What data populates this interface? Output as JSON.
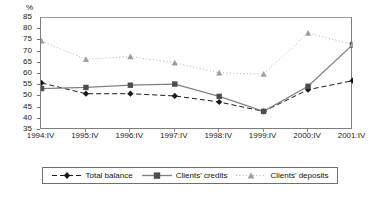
{
  "chart_data": {
    "type": "line",
    "title": "",
    "subtitle": "",
    "xlabel": "",
    "ylabel": "%",
    "unit_label": "%",
    "categories": [
      "1994:IV",
      "1995:IV",
      "1996:IV",
      "1997:IV",
      "1998:IV",
      "1999:IV",
      "2000:IV",
      "2001:IV"
    ],
    "ylim": [
      35,
      85
    ],
    "ytick_values": [
      35,
      40,
      45,
      50,
      55,
      60,
      65,
      70,
      75,
      80,
      85
    ],
    "ytick_labels": [
      "35",
      "40",
      "45",
      "50",
      "55",
      "60",
      "65",
      "70",
      "75",
      "80",
      "85"
    ],
    "grid": false,
    "legend_position": "bottom",
    "series": [
      {
        "name": "Total balance",
        "marker": "diamond",
        "line_style": "dashed",
        "color": "#1a1a1a",
        "values": [
          56.0,
          51.2,
          51.2,
          50.2,
          47.5,
          43.3,
          53.0,
          57.0
        ]
      },
      {
        "name": "Clients' credits",
        "marker": "square",
        "line_style": "solid",
        "color": "#808080",
        "values": [
          53.5,
          54.0,
          55.0,
          55.5,
          50.0,
          43.3,
          54.5,
          73.0
        ]
      },
      {
        "name": "Clients' deposits",
        "marker": "triangle",
        "line_style": "dotted",
        "color": "#b4b4b4",
        "values": [
          74.8,
          66.5,
          67.8,
          65.0,
          60.5,
          60.0,
          78.3,
          73.2
        ]
      }
    ]
  },
  "legend": {
    "items": [
      {
        "label": "Total balance"
      },
      {
        "label": "Clients' credits"
      },
      {
        "label": "Clients' deposits"
      }
    ]
  }
}
